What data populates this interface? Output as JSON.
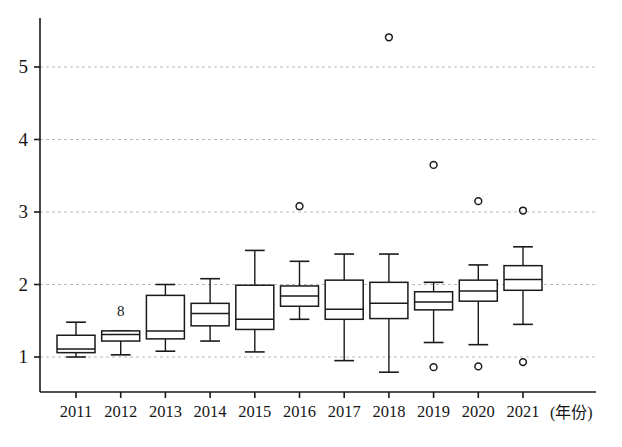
{
  "chart_data": {
    "type": "box",
    "title": "",
    "xlabel": "(年份)",
    "ylabel": "",
    "categories": [
      "2011",
      "2012",
      "2013",
      "2014",
      "2015",
      "2016",
      "2017",
      "2018",
      "2019",
      "2020",
      "2021"
    ],
    "xlim": [
      2010.5,
      2021.5
    ],
    "ylim": [
      0.62,
      5.72
    ],
    "yticks": [
      1,
      2,
      3,
      4,
      5
    ],
    "ytick_labels": [
      "1",
      "2",
      "3",
      "4",
      "5"
    ],
    "grid": "horizontal-dashed",
    "legend": "none",
    "annotations": [
      {
        "text": "8",
        "x_category": "2012",
        "y_value": 1.62
      }
    ],
    "boxes": [
      {
        "category": "2011",
        "whisker_low": 1.0,
        "q1": 1.06,
        "median": 1.11,
        "q3": 1.3,
        "whisker_high": 1.48,
        "outliers": []
      },
      {
        "category": "2012",
        "whisker_low": 1.03,
        "q1": 1.22,
        "median": 1.31,
        "q3": 1.36,
        "whisker_high": 1.36,
        "outliers": []
      },
      {
        "category": "2013",
        "whisker_low": 1.08,
        "q1": 1.25,
        "median": 1.36,
        "q3": 1.85,
        "whisker_high": 2.0,
        "outliers": []
      },
      {
        "category": "2014",
        "whisker_low": 1.22,
        "q1": 1.43,
        "median": 1.6,
        "q3": 1.74,
        "whisker_high": 2.08,
        "outliers": []
      },
      {
        "category": "2015",
        "whisker_low": 1.07,
        "q1": 1.38,
        "median": 1.52,
        "q3": 1.99,
        "whisker_high": 2.47,
        "outliers": []
      },
      {
        "category": "2016",
        "whisker_low": 1.52,
        "q1": 1.7,
        "median": 1.84,
        "q3": 1.98,
        "whisker_high": 2.32,
        "outliers": [
          3.08
        ]
      },
      {
        "category": "2017",
        "whisker_low": 0.95,
        "q1": 1.52,
        "median": 1.66,
        "q3": 2.06,
        "whisker_high": 2.42,
        "outliers": []
      },
      {
        "category": "2018",
        "whisker_low": 0.79,
        "q1": 1.53,
        "median": 1.74,
        "q3": 2.03,
        "whisker_high": 2.42,
        "outliers": [
          5.41
        ]
      },
      {
        "category": "2019",
        "whisker_low": 1.2,
        "q1": 1.65,
        "median": 1.76,
        "q3": 1.9,
        "whisker_high": 2.03,
        "outliers": [
          3.65,
          0.86
        ]
      },
      {
        "category": "2020",
        "whisker_low": 1.17,
        "q1": 1.77,
        "median": 1.91,
        "q3": 2.06,
        "whisker_high": 2.27,
        "outliers": [
          3.15,
          0.87
        ]
      },
      {
        "category": "2021",
        "whisker_low": 1.45,
        "q1": 1.92,
        "median": 2.07,
        "q3": 2.26,
        "whisker_high": 2.52,
        "outliers": [
          3.02,
          0.93
        ]
      }
    ]
  },
  "axes": {
    "y_axis_name": "value-axis",
    "x_axis_name": "year-axis",
    "unit_label": "(年份)"
  },
  "style": {
    "line_color": "#1a1a1a",
    "grid_color": "#b9b9b9",
    "background": "#ffffff",
    "marker_color": "#1a1a1a"
  }
}
